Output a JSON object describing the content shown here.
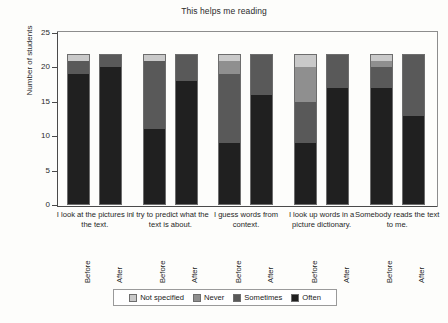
{
  "chart_data": {
    "type": "bar",
    "subtype": "stacked-bar",
    "title": "This helps me reading",
    "xlabel": "",
    "ylabel": "Number of students",
    "ylim": [
      0,
      25
    ],
    "yticks": [
      0,
      5,
      10,
      15,
      20,
      25
    ],
    "grid": false,
    "legend_position": "bottom",
    "legend": [
      "Not specified",
      "Never",
      "Sometimes",
      "Often"
    ],
    "series_colors": [
      "#c9c9c9",
      "#8f8f8f",
      "#595959",
      "#202020"
    ],
    "categories": [
      "I look at the pictures in the text.",
      "I try to predict what the text is about.",
      "I guess words from context.",
      "I look up words in a picture dictionary.",
      "Somebody reads the text to me."
    ],
    "subgroups": [
      "Before",
      "After"
    ],
    "series": [
      {
        "name": "Often",
        "values": {
          "Before": [
            19,
            11,
            9,
            9,
            17
          ],
          "After": [
            20,
            18,
            16,
            17,
            13
          ]
        }
      },
      {
        "name": "Sometimes",
        "values": {
          "Before": [
            2,
            10,
            10,
            6,
            3
          ],
          "After": [
            2,
            4,
            6,
            5,
            9
          ]
        }
      },
      {
        "name": "Never",
        "values": {
          "Before": [
            0,
            0,
            2,
            5,
            1
          ],
          "After": [
            0,
            0,
            0,
            0,
            0
          ]
        }
      },
      {
        "name": "Not specified",
        "values": {
          "Before": [
            1,
            1,
            1,
            2,
            1
          ],
          "After": [
            0,
            0,
            0,
            0,
            0
          ]
        }
      }
    ],
    "totals": {
      "Before": [
        22,
        22,
        22,
        22,
        22
      ],
      "After": [
        22,
        22,
        22,
        22,
        22
      ]
    }
  },
  "axis": {
    "y_title": "Number of students",
    "y_ticks": [
      "0",
      "5",
      "10",
      "15",
      "20",
      "25"
    ]
  },
  "legend": {
    "items": [
      {
        "label": "Not specified",
        "color": "#c9c9c9"
      },
      {
        "label": "Never",
        "color": "#8f8f8f"
      },
      {
        "label": "Sometimes",
        "color": "#595959"
      },
      {
        "label": "Often",
        "color": "#202020"
      }
    ]
  },
  "categories": [
    {
      "label": "I look at the pictures in the text.",
      "before": "Before",
      "after": "After"
    },
    {
      "label": "I try to predict what the text is about.",
      "before": "Before",
      "after": "After"
    },
    {
      "label": "I guess words from context.",
      "before": "Before",
      "after": "After"
    },
    {
      "label": "I look up words in a picture dictionary.",
      "before": "Before",
      "after": "After"
    },
    {
      "label": "Somebody reads the text to me.",
      "before": "Before",
      "after": "After"
    }
  ],
  "title": "This helps me reading"
}
